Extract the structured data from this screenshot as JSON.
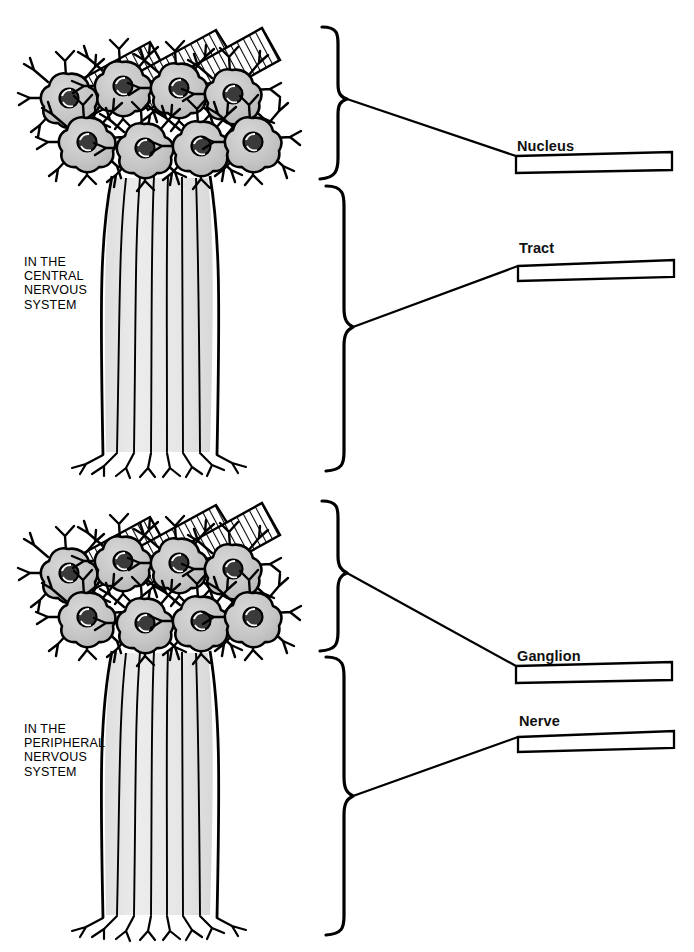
{
  "figure": {
    "background_color": "#ffffff",
    "ink_color": "#000000",
    "soma_fill_color": "#c9c9c9",
    "axon_fill_color": "#e2e2e2"
  },
  "regions": [
    {
      "id": "cns",
      "label": "IN THE\nCENTRAL\nNERVOUS\nSYSTEM",
      "cluster_name": "neuron-cell-body-cluster",
      "bundle_name": "axon-bundle"
    },
    {
      "id": "pns",
      "label": "IN THE\nPERIPHERAL\nNERVOUS\nSYSTEM",
      "cluster_name": "neuron-cell-body-cluster",
      "bundle_name": "axon-bundle"
    }
  ],
  "callouts": [
    {
      "id": "nucleus",
      "label": "Nucleus",
      "region": "cns"
    },
    {
      "id": "tract",
      "label": "Tract",
      "region": "cns"
    },
    {
      "id": "ganglion",
      "label": "Ganglion",
      "region": "pns"
    },
    {
      "id": "nerve",
      "label": "Nerve",
      "region": "pns"
    }
  ]
}
